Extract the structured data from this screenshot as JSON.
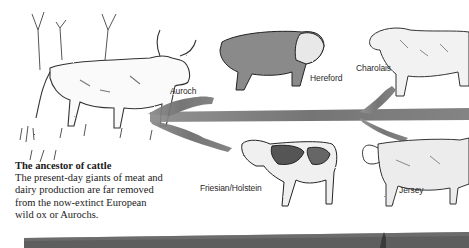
{
  "caption": {
    "title": "The ancestor of cattle",
    "body": "The present-day giants of meat and dairy production are far removed from the now-extinct European wild ox or Aurochs."
  },
  "breeds": [
    {
      "label": "Auroch",
      "role": "ancestor"
    },
    {
      "label": "Hereford",
      "role": "beef"
    },
    {
      "label": "Charolais",
      "role": "beef"
    },
    {
      "label": "Friesian/Holstein",
      "role": "dairy"
    },
    {
      "label": "Jersey",
      "role": "dairy"
    }
  ],
  "colors": {
    "ink": "#2a2a2a",
    "arrow": "#6e6e6e",
    "bar": "#5a5a5a",
    "background": "#ffffff"
  }
}
